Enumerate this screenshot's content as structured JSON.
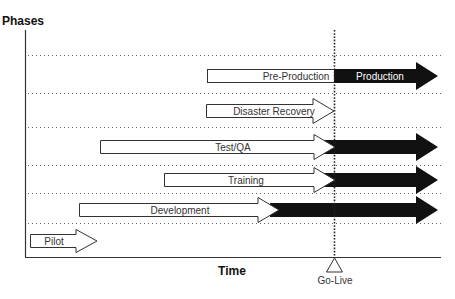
{
  "diagram": {
    "y_axis_label": "Phases",
    "x_axis_label": "Time",
    "milestone": {
      "label": "Go-Live",
      "icon": "triangle-marker-icon"
    },
    "phases": [
      {
        "id": "pre-production",
        "pre_label": "Pre-Production",
        "post_label": "Production",
        "style": "bar-then-dark-arrow"
      },
      {
        "id": "disaster-recovery",
        "pre_label": "Disaster Recovery",
        "post_label": "",
        "style": "white-arrow"
      },
      {
        "id": "test-qa",
        "pre_label": "Test/QA",
        "post_label": "",
        "style": "white-then-dark-arrow"
      },
      {
        "id": "training",
        "pre_label": "Training",
        "post_label": "",
        "style": "white-then-dark-arrow"
      },
      {
        "id": "development",
        "pre_label": "Development",
        "post_label": "",
        "style": "white-then-dark-arrow"
      },
      {
        "id": "pilot",
        "pre_label": "Pilot",
        "post_label": "",
        "style": "white-arrow"
      }
    ],
    "colors": {
      "outline": "#333333",
      "dark_fill": "#111111",
      "light_fill": "#ffffff",
      "grid": "#555555"
    }
  }
}
